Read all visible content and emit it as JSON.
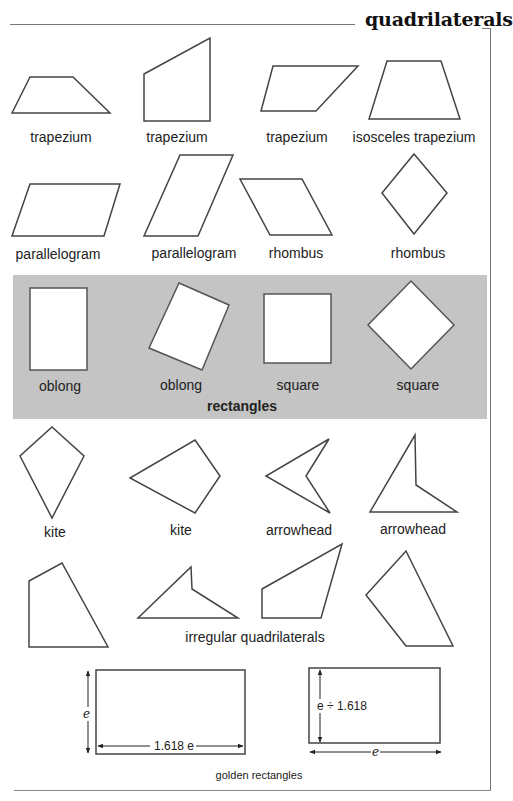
{
  "page": {
    "title": "quadrilaterals"
  },
  "shapes": [
    {
      "id": "trapezium-1",
      "label": "trapezium",
      "row": 1
    },
    {
      "id": "trapezium-2",
      "label": "trapezium",
      "row": 1
    },
    {
      "id": "trapezium-3",
      "label": "trapezium",
      "row": 1
    },
    {
      "id": "isosceles-trapezium",
      "label": "isosceles trapezium",
      "row": 1
    },
    {
      "id": "parallelogram-1",
      "label": "parallelogram",
      "row": 2
    },
    {
      "id": "parallelogram-2",
      "label": "parallelogram",
      "row": 2
    },
    {
      "id": "rhombus-1",
      "label": "rhombus",
      "row": 2
    },
    {
      "id": "rhombus-2",
      "label": "rhombus",
      "row": 2
    },
    {
      "id": "oblong-1",
      "label": "oblong",
      "row": 3
    },
    {
      "id": "oblong-2",
      "label": "oblong",
      "row": 3
    },
    {
      "id": "square-1",
      "label": "square",
      "row": 3
    },
    {
      "id": "square-2",
      "label": "square",
      "row": 3
    },
    {
      "id": "kite-1",
      "label": "kite",
      "row": 4
    },
    {
      "id": "kite-2",
      "label": "kite",
      "row": 4
    },
    {
      "id": "arrowhead-1",
      "label": "arrowhead",
      "row": 4
    },
    {
      "id": "arrowhead-2",
      "label": "arrowhead",
      "row": 4
    }
  ],
  "groups": {
    "rectangles": {
      "label": "rectangles",
      "background": "#c4c4c4"
    },
    "irregular": {
      "label": "irregular quadrilaterals"
    },
    "golden": {
      "label": "golden rectangles",
      "left_height_label": "e",
      "left_width_label": "1.618 e",
      "right_height_label": "e ÷ 1.618",
      "right_width_label": "e"
    }
  },
  "colors": {
    "stroke": "#444444",
    "panel": "#c4c4c4",
    "text": "#222222"
  }
}
